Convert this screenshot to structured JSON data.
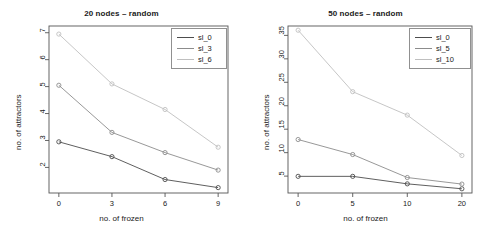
{
  "figure": {
    "width": 487,
    "height": 235,
    "background": "#ffffff",
    "panel_count": 2
  },
  "chart_data": [
    {
      "type": "line",
      "title": "20 nodes – random",
      "xlabel": "no. of frozen",
      "ylabel": "no. of attractors",
      "categories": [
        "0",
        "3",
        "6",
        "9"
      ],
      "x": [
        0,
        3,
        6,
        9
      ],
      "xtick_labels": [
        "0",
        "3",
        "6",
        "9"
      ],
      "ytick_labels": [
        "2",
        "3",
        "4",
        "5",
        "6",
        "7"
      ],
      "yticks": [
        2,
        3,
        4,
        5,
        6,
        7
      ],
      "ylim": [
        1.05,
        7.25
      ],
      "grid": false,
      "legend_position": "top-right",
      "marker": "open-circle",
      "series": [
        {
          "name": "sl_0",
          "values": [
            2.95,
            2.4,
            1.55,
            1.25
          ],
          "color": "#4d4d4d"
        },
        {
          "name": "sl_3",
          "values": [
            5.05,
            3.3,
            2.55,
            1.9
          ],
          "color": "#8c8c8c"
        },
        {
          "name": "sl_6",
          "values": [
            6.95,
            5.1,
            4.15,
            2.75
          ],
          "color": "#bfbfbf"
        }
      ]
    },
    {
      "type": "line",
      "title": "50 nodes – random",
      "xlabel": "no. of frozen",
      "ylabel": "no. of attractors",
      "categories": [
        "0",
        "5",
        "10",
        "20"
      ],
      "x": [
        0,
        5,
        10,
        20
      ],
      "xtick_labels": [
        "0",
        "5",
        "10",
        "20"
      ],
      "ytick_labels": [
        "5",
        "10",
        "15",
        "20",
        "25",
        "30",
        "35"
      ],
      "yticks": [
        5,
        10,
        15,
        20,
        25,
        30,
        35
      ],
      "ylim": [
        1.4,
        37.0
      ],
      "grid": false,
      "legend_position": "top-right",
      "marker": "open-circle",
      "series": [
        {
          "name": "sl_0",
          "values": [
            4.95,
            4.95,
            3.35,
            2.3
          ],
          "color": "#4d4d4d"
        },
        {
          "name": "sl_5",
          "values": [
            12.8,
            9.6,
            4.7,
            3.3
          ],
          "color": "#8c8c8c"
        },
        {
          "name": "sl_10",
          "values": [
            36.1,
            23.0,
            18.0,
            9.4
          ],
          "color": "#bfbfbf"
        }
      ]
    }
  ]
}
